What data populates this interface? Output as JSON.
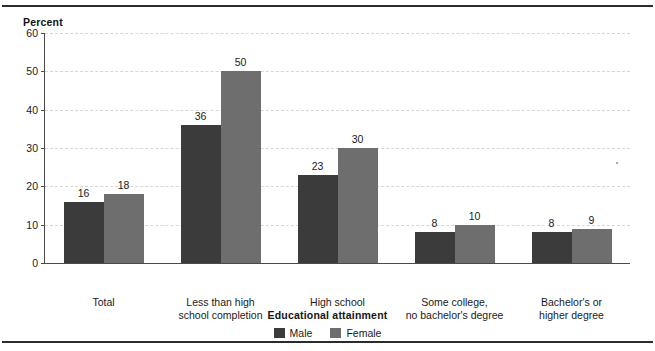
{
  "figure": {
    "y_axis_title": "Percent",
    "x_axis_title": "Educational attainment"
  },
  "legend": {
    "items": [
      {
        "label": "Male",
        "color": "#3b3b3b",
        "swatch_name": "legend-swatch-male"
      },
      {
        "label": "Female",
        "color": "#6e6e6e",
        "swatch_name": "legend-swatch-female"
      }
    ]
  },
  "chart_data": {
    "type": "bar",
    "title": "",
    "subtitle": "",
    "xlabel": "Educational attainment",
    "ylabel": "Percent",
    "ylim": [
      0,
      60
    ],
    "yticks": [
      0,
      10,
      20,
      30,
      40,
      50,
      60
    ],
    "ytick_labels": [
      "0",
      "10",
      "20",
      "30",
      "40",
      "50",
      "60"
    ],
    "grid": true,
    "grid_axis": "y",
    "grid_style": "dashed",
    "legend_position": "bottom-center",
    "categories": [
      "Total",
      "Less than high school completion",
      "High school",
      "Some college, no bachelor's degree",
      "Bachelor's or higher degree"
    ],
    "category_label_lines": [
      [
        "Total"
      ],
      [
        "Less than high",
        "school completion"
      ],
      [
        "High school"
      ],
      [
        "Some college,",
        "no bachelor's degree"
      ],
      [
        "Bachelor's or",
        "higher degree"
      ]
    ],
    "series": [
      {
        "name": "Male",
        "color": "#3b3b3b",
        "values": [
          16,
          36,
          23,
          8,
          8
        ]
      },
      {
        "name": "Female",
        "color": "#6e6e6e",
        "values": [
          18,
          50,
          30,
          10,
          9
        ]
      }
    ],
    "value_labels": {
      "Male": [
        "16",
        "36",
        "23",
        "8",
        "8"
      ],
      "Female": [
        "18",
        "50",
        "30",
        "10",
        "9"
      ]
    }
  }
}
